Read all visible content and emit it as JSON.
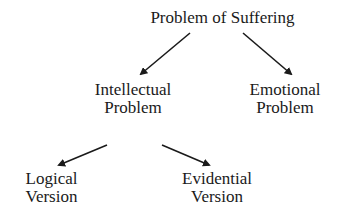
{
  "diagram": {
    "type": "tree",
    "nodes": {
      "root": {
        "line1": "Problem of Suffering"
      },
      "intellectual": {
        "line1": "Intellectual",
        "line2": "Problem"
      },
      "emotional": {
        "line1": "Emotional",
        "line2": "Problem"
      },
      "logical": {
        "line1": "Logical",
        "line2": "Version"
      },
      "evidential": {
        "line1": "Evidential",
        "line2": "Version"
      }
    },
    "edges": [
      {
        "from": "Problem of Suffering",
        "to": "Intellectual Problem"
      },
      {
        "from": "Problem of Suffering",
        "to": "Emotional Problem"
      },
      {
        "from": "Intellectual Problem",
        "to": "Logical Version"
      },
      {
        "from": "Intellectual Problem",
        "to": "Evidential Version"
      }
    ]
  }
}
